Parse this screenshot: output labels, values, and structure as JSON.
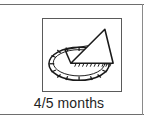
{
  "card": {
    "caption": "4/5 months",
    "icon": {
      "name": "sundial-icon",
      "description": "sundial with elliptical dial face, radial hour tick marks and triangular gnomon",
      "line_color": "#1a1a1a",
      "fill_color": "#ffffff",
      "frame_color": "#5a5a5a"
    },
    "rule_color": "#6e6e6e",
    "background_color": "#ffffff",
    "text_color": "#1f1f1f"
  }
}
